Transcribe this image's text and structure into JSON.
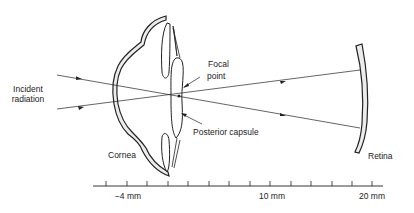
{
  "diagram": {
    "type": "eye-optics-cross-section",
    "labels": {
      "incident_line1": "Incident",
      "incident_line2": "radiation",
      "focal_line1": "Focal",
      "focal_line2": "point",
      "posterior_capsule": "Posterior capsule",
      "cornea": "Cornea",
      "retina": "Retina"
    },
    "scale": {
      "labels": [
        "−4 mm",
        "10 mm",
        "20 mm"
      ],
      "tick_count": 14
    },
    "colors": {
      "line": "#222222",
      "tissue_fill": "#e8e8e8",
      "background": "#ffffff"
    }
  }
}
